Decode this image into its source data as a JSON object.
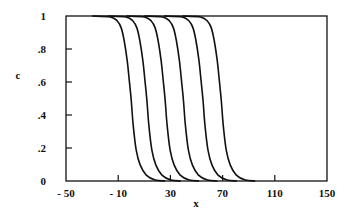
{
  "chart_data": {
    "type": "line",
    "title": "",
    "xlabel": "x",
    "ylabel": "c",
    "xlim": [
      -50,
      150
    ],
    "ylim": [
      0,
      1
    ],
    "xticks": [
      -50,
      -10,
      30,
      70,
      110,
      150
    ],
    "xtick_labels": [
      "- 50",
      "- 10",
      "30",
      "70",
      "110",
      "150"
    ],
    "yticks": [
      0,
      0.2,
      0.4,
      0.6,
      0.8,
      1
    ],
    "ytick_labels": [
      "0",
      ".2",
      ".4",
      ".6",
      ".8",
      "1"
    ],
    "grid": false,
    "legend": null,
    "line_color": "#111111",
    "profile_shape": {
      "dx": [
        -30,
        -16,
        -10.7,
        -7.7,
        -5.4,
        -3.1,
        -1.5,
        0,
        1.5,
        3.8,
        6.9,
        11.5,
        18.4,
        26
      ],
      "c": [
        1,
        0.994,
        0.97,
        0.928,
        0.85,
        0.729,
        0.608,
        0.488,
        0.337,
        0.187,
        0.096,
        0.036,
        0.006,
        0
      ]
    },
    "series": [
      {
        "name": "profile 1",
        "midpoint_x": 0
      },
      {
        "name": "profile 2",
        "midpoint_x": 12
      },
      {
        "name": "profile 3",
        "midpoint_x": 26
      },
      {
        "name": "profile 4",
        "midpoint_x": 40
      },
      {
        "name": "profile 5",
        "midpoint_x": 55
      },
      {
        "name": "profile 6",
        "midpoint_x": 69
      }
    ]
  }
}
